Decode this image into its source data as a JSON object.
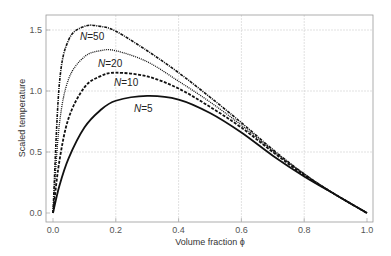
{
  "chart_data": {
    "type": "line",
    "title": "",
    "xlabel": "Volume fraction ϕ",
    "ylabel": "Scaled temperature",
    "xlim": [
      0,
      1.0
    ],
    "ylim": [
      0,
      1.6
    ],
    "grid": true,
    "x_ticks": [
      "0.0",
      "0.2",
      "0.4",
      "0.6",
      "0.8",
      "1.0"
    ],
    "y_ticks": [
      "0.0",
      "0.5",
      "1.0",
      "1.5"
    ],
    "legend_position": "inline labels",
    "x": [
      0.0,
      0.02,
      0.05,
      0.1,
      0.15,
      0.2,
      0.3,
      0.4,
      0.5,
      0.6,
      0.7,
      0.8,
      0.9,
      1.0
    ],
    "series": [
      {
        "name": "N=5",
        "style": "solid",
        "values": [
          0.0,
          0.22,
          0.45,
          0.7,
          0.84,
          0.92,
          0.96,
          0.93,
          0.82,
          0.66,
          0.47,
          0.3,
          0.15,
          0.0
        ]
      },
      {
        "name": "N=10",
        "style": "dashed",
        "values": [
          0.0,
          0.42,
          0.78,
          1.03,
          1.12,
          1.15,
          1.12,
          1.02,
          0.87,
          0.7,
          0.5,
          0.31,
          0.15,
          0.0
        ]
      },
      {
        "name": "N=20",
        "style": "dotted",
        "values": [
          0.0,
          0.72,
          1.1,
          1.28,
          1.33,
          1.33,
          1.24,
          1.08,
          0.91,
          0.72,
          0.51,
          0.32,
          0.15,
          0.0
        ]
      },
      {
        "name": "N=50",
        "style": "dash-dot",
        "values": [
          0.0,
          1.05,
          1.42,
          1.53,
          1.53,
          1.49,
          1.33,
          1.15,
          0.95,
          0.74,
          0.52,
          0.32,
          0.15,
          0.0
        ]
      }
    ],
    "annotations": [
      "N=50",
      "N=20",
      "N=10",
      "N=5"
    ]
  }
}
